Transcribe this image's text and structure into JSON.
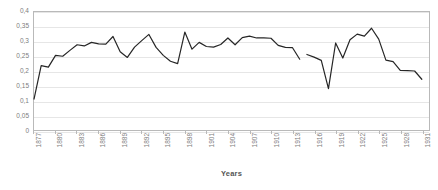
{
  "chart_data": {
    "type": "line",
    "title": "",
    "xlabel": "Years",
    "ylabel": "",
    "grid": true,
    "legend": false,
    "xlim": [
      1877,
      1932
    ],
    "ylim": [
      0,
      0.4
    ],
    "y_ticks": [
      "0",
      "0,05",
      "0,1",
      "0,15",
      "0,2",
      "0,25",
      "0,3",
      "0,35",
      "0,4"
    ],
    "y_tick_values": [
      0,
      0.05,
      0.1,
      0.15,
      0.2,
      0.25,
      0.3,
      0.35,
      0.4
    ],
    "x_ticks": [
      "1877",
      "1880",
      "1883",
      "1886",
      "1889",
      "1892",
      "1895",
      "1898",
      "1901",
      "1904",
      "1907",
      "1910",
      "1913",
      "1916",
      "1919",
      "1922",
      "1925",
      "1928",
      "1931"
    ],
    "x_tick_values": [
      1877,
      1880,
      1883,
      1886,
      1889,
      1892,
      1895,
      1898,
      1901,
      1904,
      1907,
      1910,
      1913,
      1916,
      1919,
      1922,
      1925,
      1928,
      1931
    ],
    "line_color": "#262626",
    "series": [
      {
        "name": "series-1",
        "x": [
          1877,
          1878,
          1879,
          1880,
          1881,
          1882,
          1883,
          1884,
          1885,
          1886,
          1887,
          1888,
          1889,
          1890,
          1891,
          1892,
          1893,
          1894,
          1895,
          1896,
          1897,
          1898,
          1899,
          1900,
          1901,
          1902,
          1903,
          1904,
          1905,
          1906,
          1907,
          1908,
          1909,
          1910,
          1911,
          1912,
          1913,
          1914
        ],
        "values": [
          0.105,
          0.218,
          0.213,
          0.253,
          0.25,
          0.27,
          0.289,
          0.285,
          0.297,
          0.292,
          0.291,
          0.317,
          0.265,
          0.246,
          0.281,
          0.303,
          0.324,
          0.28,
          0.253,
          0.233,
          0.225,
          0.332,
          0.274,
          0.297,
          0.283,
          0.281,
          0.29,
          0.312,
          0.289,
          0.313,
          0.318,
          0.312,
          0.312,
          0.311,
          0.287,
          0.28,
          0.279,
          0.24
        ]
      },
      {
        "name": "series-1-continued",
        "x": [
          1915,
          1916,
          1917,
          1918,
          1919,
          1920,
          1921,
          1922,
          1923,
          1924,
          1925,
          1926,
          1927,
          1928,
          1929,
          1930,
          1931
        ],
        "values": [
          0.256,
          0.247,
          0.236,
          0.14,
          0.295,
          0.244,
          0.306,
          0.325,
          0.318,
          0.345,
          0.308,
          0.237,
          0.232,
          0.202,
          0.201,
          0.2,
          0.172
        ]
      }
    ],
    "gaps": [
      {
        "after_year": 1916,
        "before_year": 1918
      }
    ]
  }
}
